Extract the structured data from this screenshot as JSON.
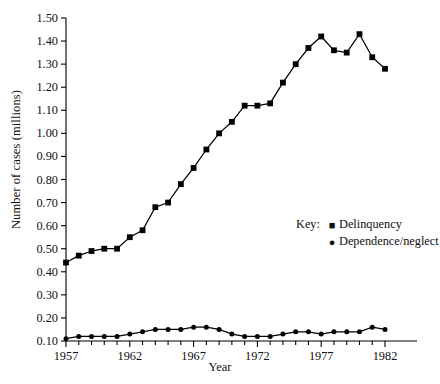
{
  "chart_data": {
    "type": "line",
    "title": "",
    "xlabel": "Year",
    "ylabel": "Number of cases (millions)",
    "grid": false,
    "legend_position": "center-right",
    "legend_title": "Key:",
    "xlim": [
      1957,
      1982
    ],
    "ylim": [
      0.1,
      1.5
    ],
    "ytick_labels": [
      "1.50",
      "1.40",
      "1.30",
      "1.20",
      "1.10",
      "1.00",
      "0.90",
      "0.80",
      "0.70",
      "0.60",
      "0.50",
      "0.40",
      "0.30",
      "0.20",
      "0.10"
    ],
    "ytick_values": [
      1.5,
      1.4,
      1.3,
      1.2,
      1.1,
      1.0,
      0.9,
      0.8,
      0.7,
      0.6,
      0.5,
      0.4,
      0.3,
      0.2,
      0.1
    ],
    "xtick_labels": [
      "1957",
      "1962",
      "1967",
      "1972",
      "1977",
      "1982"
    ],
    "xtick_values": [
      1957,
      1962,
      1967,
      1972,
      1977,
      1982
    ],
    "x": [
      1957,
      1958,
      1959,
      1960,
      1961,
      1962,
      1963,
      1964,
      1965,
      1966,
      1967,
      1968,
      1969,
      1970,
      1971,
      1972,
      1973,
      1974,
      1975,
      1976,
      1977,
      1978,
      1979,
      1980,
      1981,
      1982
    ],
    "series": [
      {
        "name": "Delinquency",
        "marker": "square",
        "color": "#000000",
        "values": [
          0.44,
          0.47,
          0.49,
          0.5,
          0.5,
          0.55,
          0.58,
          0.68,
          0.7,
          0.78,
          0.85,
          0.93,
          1.0,
          1.05,
          1.12,
          1.12,
          1.13,
          1.22,
          1.3,
          1.37,
          1.42,
          1.36,
          1.35,
          1.43,
          1.33,
          1.28
        ]
      },
      {
        "name": "Dependence/neglect",
        "marker": "circle",
        "color": "#000000",
        "values": [
          0.11,
          0.12,
          0.12,
          0.12,
          0.12,
          0.13,
          0.14,
          0.15,
          0.15,
          0.15,
          0.16,
          0.16,
          0.15,
          0.13,
          0.12,
          0.12,
          0.12,
          0.13,
          0.14,
          0.14,
          0.13,
          0.14,
          0.14,
          0.14,
          0.16,
          0.15
        ]
      }
    ]
  },
  "axis": {
    "y_title": "Number of cases (millions)",
    "x_title": "Year"
  },
  "legend": {
    "key_label": "Key:",
    "entries": [
      {
        "marker": "■",
        "label": "Delinquency"
      },
      {
        "marker": "●",
        "label": "Dependence/neglect"
      }
    ]
  }
}
